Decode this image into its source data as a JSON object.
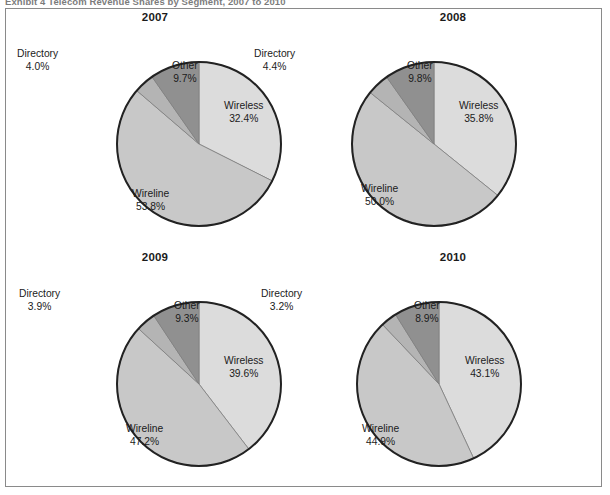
{
  "exhibit": {
    "title": "Exhibit 4 Telecom Revenue Shares by Segment, 2007 to 2010"
  },
  "colors": {
    "wireless": "#dcdcdc",
    "wireline": "#c8c8c8",
    "directory": "#b4b4b4",
    "other": "#909090",
    "outline": "#222222",
    "frame": "#8a8a8a"
  },
  "chart_data": {
    "type": "pie",
    "title": "Exhibit 4 Telecom Revenue Shares by Segment, 2007 to 2010",
    "categories": [
      "Wireless",
      "Wireline",
      "Directory",
      "Other"
    ],
    "charts": [
      {
        "title": "2007",
        "labels": {
          "wireless_name": "Wireless",
          "wireless_value": "32.4%",
          "wireline_name": "Wireline",
          "wireline_value": "53.8%",
          "directory_name": "Directory",
          "directory_value": "4.0%",
          "other_name": "Other",
          "other_value": "9.7%"
        },
        "values": [
          32.4,
          53.8,
          4.0,
          9.7
        ]
      },
      {
        "title": "2008",
        "labels": {
          "wireless_name": "Wireless",
          "wireless_value": "35.8%",
          "wireline_name": "Wireline",
          "wireline_value": "50.0%",
          "directory_name": "Directory",
          "directory_value": "4.4%",
          "other_name": "Other",
          "other_value": "9.8%"
        },
        "values": [
          35.8,
          50.0,
          4.4,
          9.8
        ]
      },
      {
        "title": "2009",
        "labels": {
          "wireless_name": "Wireless",
          "wireless_value": "39.6%",
          "wireline_name": "Wireline",
          "wireline_value": "47.2%",
          "directory_name": "Directory",
          "directory_value": "3.9%",
          "other_name": "Other",
          "other_value": "9.3%"
        },
        "values": [
          39.6,
          47.2,
          3.9,
          9.3
        ]
      },
      {
        "title": "2010",
        "labels": {
          "wireless_name": "Wireless",
          "wireless_value": "43.1%",
          "wireline_name": "Wireline",
          "wireline_value": "44.9%",
          "directory_name": "Directory",
          "directory_value": "3.2%",
          "other_name": "Other",
          "other_value": "8.9%"
        },
        "values": [
          43.1,
          44.9,
          3.2,
          8.9
        ]
      }
    ],
    "legend_position": "inline-labels",
    "grid": false
  }
}
